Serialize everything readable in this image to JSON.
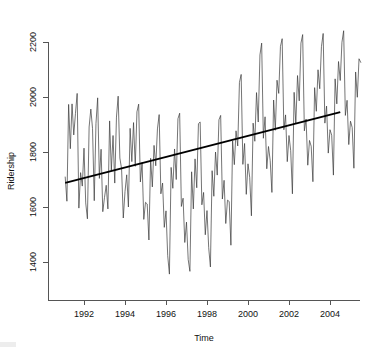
{
  "chart_data": {
    "type": "line",
    "title": "",
    "subtitle": "",
    "xlabel": "Time",
    "ylabel": "Ridership",
    "xlim": [
      1991.0,
      1991.0
    ],
    "ylim": [
      1330,
      2260
    ],
    "grid": false,
    "legend": null,
    "x_ticks": [
      "1992",
      "1994",
      "1996",
      "1998",
      "2000",
      "2002",
      "2004"
    ],
    "x_tick_values": [
      1992,
      1994,
      1996,
      1998,
      2000,
      2002,
      2004
    ],
    "y_ticks": [
      "1400",
      "1600",
      "1800",
      "2000",
      "2200"
    ],
    "y_tick_values": [
      1400,
      1600,
      1800,
      2000,
      2200
    ],
    "series": [
      {
        "name": "Ridership",
        "kind": "line",
        "x_start": 1991.0833,
        "x_step": 0.08333,
        "values": [
          1709,
          1621,
          1973,
          1812,
          1975,
          1862,
          1940,
          2013,
          1596,
          1725,
          1676,
          1814,
          1615,
          1557,
          1891,
          1956,
          1885,
          1623,
          1903,
          1997,
          1704,
          1810,
          1583,
          1635,
          1679,
          1593,
          1913,
          1733,
          1860,
          1687,
          1927,
          2003,
          1778,
          1739,
          1560,
          1656,
          1717,
          1600,
          1886,
          1765,
          1907,
          1748,
          1946,
          1974,
          1691,
          1762,
          1555,
          1617,
          1611,
          1480,
          1777,
          1673,
          1824,
          1750,
          1884,
          1936,
          1648,
          1687,
          1526,
          1586,
          1423,
          1356,
          1744,
          1668,
          1811,
          1700,
          1921,
          1941,
          1602,
          1632,
          1471,
          1545,
          1409,
          1366,
          1728,
          1593,
          1775,
          1670,
          1903,
          1909,
          1608,
          1653,
          1499,
          1587,
          1452,
          1382,
          1732,
          1639,
          1800,
          1716,
          1917,
          1933,
          1629,
          1697,
          1540,
          1625,
          1620,
          1461,
          1840,
          1754,
          1877,
          1822,
          2053,
          2082,
          1755,
          1831,
          1646,
          1757,
          1708,
          1568,
          1905,
          1839,
          2016,
          1909,
          2153,
          2196,
          1850,
          1928,
          1739,
          1820,
          1769,
          1653,
          1989,
          1879,
          2061,
          2013,
          2184,
          2212,
          1881,
          1935,
          1765,
          1860,
          1805,
          1648,
          2017,
          1903,
          2078,
          1986,
          2196,
          2227,
          1877,
          1920,
          1752,
          1842,
          1821,
          1692,
          2034,
          1948,
          2099,
          2030,
          2183,
          2231,
          1905,
          1967,
          1796,
          1881,
          1861,
          1716,
          2066,
          1975,
          2129,
          2060,
          2199,
          2241,
          1933,
          1988,
          1827,
          1912,
          1889,
          1741,
          2091,
          1999,
          2139,
          2126
        ]
      },
      {
        "name": "Linear trend",
        "kind": "trend",
        "x_from": 1991.0833,
        "x_to": 2004.5,
        "y_from": 1688,
        "y_to": 1945
      }
    ]
  },
  "axes": {
    "y_title": "Ridership",
    "x_title": "Time"
  }
}
